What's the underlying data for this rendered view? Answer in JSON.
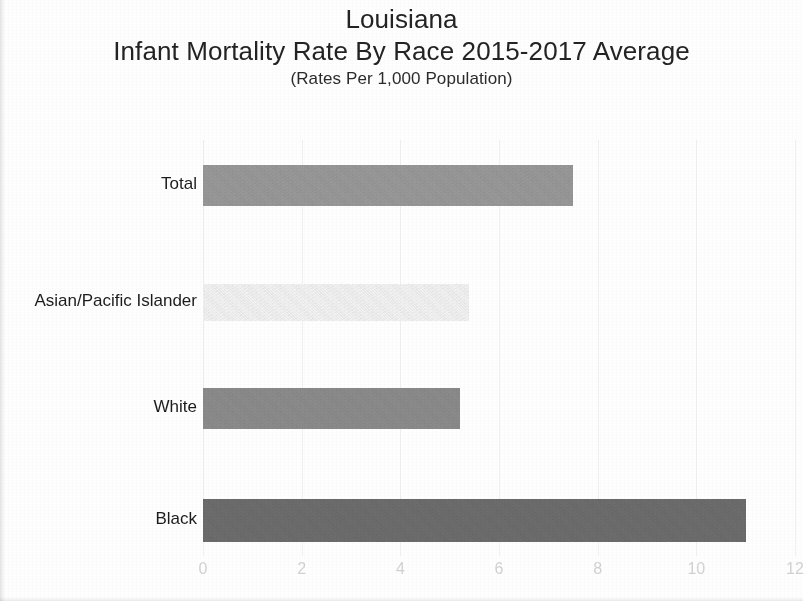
{
  "titles": {
    "main": "Louisiana",
    "sub": "Infant Mortality Rate By Race 2015-2017 Average",
    "note": "(Rates Per 1,000 Population)"
  },
  "chart_data": {
    "type": "bar",
    "orientation": "horizontal",
    "title": "Louisiana Infant Mortality Rate By Race 2015-2017 Average",
    "subtitle": "(Rates Per 1,000 Population)",
    "xlabel": "",
    "ylabel": "",
    "xlim": [
      0,
      12
    ],
    "xticks": [
      0,
      2,
      4,
      6,
      8,
      10,
      12
    ],
    "xtick_labels": [
      "0",
      "2",
      "4",
      "6",
      "8",
      "10",
      "12"
    ],
    "grid": true,
    "legend": false,
    "categories": [
      "Total",
      "Asian/Pacific Islander",
      "White",
      "Black"
    ],
    "values": [
      7.5,
      5.4,
      5.2,
      11.0
    ],
    "bar_colors": [
      "#9a9a9a",
      "#f4f4f4",
      "#8d8d8d",
      "#6e6e6e"
    ],
    "bars": [
      {
        "category": "Total",
        "value": 7.5,
        "color": "#9a9a9a"
      },
      {
        "category": "Asian/Pacific Islander",
        "value": 5.4,
        "color": "#f4f4f4"
      },
      {
        "category": "White",
        "value": 5.2,
        "color": "#8d8d8d"
      },
      {
        "category": "Black",
        "value": 11.0,
        "color": "#6e6e6e"
      }
    ]
  }
}
